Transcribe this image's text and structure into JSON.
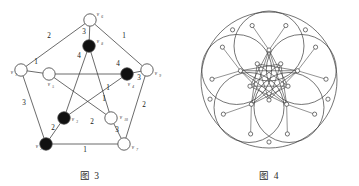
{
  "figures": [
    {
      "id": "fig3",
      "caption": "图 3",
      "type": "weighted-petersen-graph",
      "outer_vertices": [
        {
          "id": "v6",
          "label": "v",
          "sub": "6",
          "x": 90,
          "y": 20,
          "fill": "white"
        },
        {
          "id": "v1",
          "label": "v",
          "sub": "1",
          "x": 21,
          "y": 70,
          "fill": "white"
        },
        {
          "id": "v9",
          "label": "v",
          "sub": "9",
          "x": 147,
          "y": 70,
          "fill": "white"
        },
        {
          "id": "v2",
          "label": "v",
          "sub": "2",
          "x": 46,
          "y": 144,
          "fill": "black"
        },
        {
          "id": "v7",
          "label": "v",
          "sub": "7",
          "x": 124,
          "y": 144,
          "fill": "white"
        }
      ],
      "inner_vertices": [
        {
          "id": "v8",
          "label": "v",
          "sub": "8",
          "x": 89,
          "y": 46,
          "fill": "black"
        },
        {
          "id": "v5",
          "label": "v",
          "sub": "5",
          "x": 49,
          "y": 74,
          "fill": "white"
        },
        {
          "id": "v4",
          "label": "v",
          "sub": "4",
          "x": 127,
          "y": 74,
          "fill": "black"
        },
        {
          "id": "v3",
          "label": "v",
          "sub": "3",
          "x": 64,
          "y": 118,
          "fill": "black"
        },
        {
          "id": "v10",
          "label": "v",
          "sub": "10",
          "x": 111,
          "y": 118,
          "fill": "white"
        }
      ],
      "outer_edges": [
        {
          "from": "v6",
          "to": "v1",
          "weight": "2",
          "lx": 49,
          "ly": 38
        },
        {
          "from": "v6",
          "to": "v9",
          "weight": "1",
          "lx": 124,
          "ly": 38
        },
        {
          "from": "v1",
          "to": "v2",
          "weight": "3",
          "lx": 24,
          "ly": 105
        },
        {
          "from": "v9",
          "to": "v7",
          "weight": "2",
          "lx": 144,
          "ly": 107
        },
        {
          "from": "v2",
          "to": "v7",
          "weight": "1",
          "lx": 85,
          "ly": 152
        }
      ],
      "spoke_edges": [
        {
          "from": "v6",
          "to": "v8",
          "weight": "3",
          "lx": 84,
          "ly": 34
        },
        {
          "from": "v1",
          "to": "v5",
          "weight": "1",
          "lx": 36,
          "ly": 64
        },
        {
          "from": "v9",
          "to": "v4",
          "weight": "3",
          "lx": 139,
          "ly": 80
        },
        {
          "from": "v2",
          "to": "v3",
          "weight": "2",
          "lx": 53,
          "ly": 130
        },
        {
          "from": "v7",
          "to": "v10",
          "weight": "3",
          "lx": 117,
          "ly": 132
        }
      ],
      "star_edges": [
        {
          "from": "v8",
          "to": "v3",
          "weight": "4",
          "lx": 79,
          "ly": 58
        },
        {
          "from": "v8",
          "to": "v10",
          "weight": "1",
          "lx": 108,
          "ly": 90
        },
        {
          "from": "v5",
          "to": "v4",
          "weight": "4",
          "lx": 118,
          "ly": 66
        },
        {
          "from": "v5",
          "to": "v10",
          "weight": "2",
          "lx": 92,
          "ly": 124
        },
        {
          "from": "v4",
          "to": "v3",
          "weight": "1",
          "lx": 104,
          "ly": 101
        }
      ]
    },
    {
      "id": "fig4",
      "caption": "图 4",
      "type": "circular-lobe-star-graph",
      "description": "five overlapping large circles enclosing a ten-point star linkage"
    }
  ],
  "colors": {
    "stroke": "#3a3a3a",
    "node_fill_white": "#ffffff",
    "node_fill_black": "#111111",
    "text": "#1a1a1a",
    "background": "#ffffff"
  }
}
